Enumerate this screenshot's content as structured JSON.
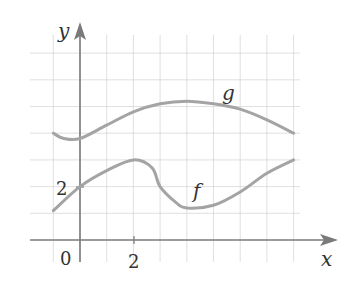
{
  "chart_data": {
    "type": "line",
    "title": "",
    "xlabel": "x",
    "ylabel": "y",
    "xlim": [
      -2,
      9.5
    ],
    "ylim": [
      -0.8,
      7.5
    ],
    "grid": true,
    "x_tick_labels": [
      {
        "value": 0,
        "label": "0"
      },
      {
        "value": 2,
        "label": "2"
      }
    ],
    "y_tick_labels": [
      {
        "value": 2,
        "label": "2"
      }
    ],
    "series": [
      {
        "name": "g",
        "points": [
          [
            -1,
            4.0
          ],
          [
            -0.6,
            3.8
          ],
          [
            0,
            3.8
          ],
          [
            1,
            4.3
          ],
          [
            2,
            4.8
          ],
          [
            3,
            5.1
          ],
          [
            4,
            5.2
          ],
          [
            5,
            5.1
          ],
          [
            6,
            4.9
          ],
          [
            7,
            4.5
          ],
          [
            8,
            4.0
          ]
        ],
        "label_position": [
          5.5,
          5.6
        ]
      },
      {
        "name": "f",
        "points": [
          [
            -1,
            1.1
          ],
          [
            0,
            2.0
          ],
          [
            1,
            2.6
          ],
          [
            2,
            3.0
          ],
          [
            2.7,
            2.7
          ],
          [
            3,
            2.0
          ],
          [
            3.6,
            1.4
          ],
          [
            4,
            1.2
          ],
          [
            5,
            1.3
          ],
          [
            6,
            1.8
          ],
          [
            7,
            2.5
          ],
          [
            8,
            3.0
          ]
        ],
        "label_position": [
          4.4,
          1.7
        ]
      }
    ],
    "legend": "none (curves labeled inline)",
    "colors": {
      "curve": "#a4a4a4",
      "axis": "#7a7a7a",
      "grid": "#d8d8d8"
    }
  },
  "labels": {
    "x_axis": "x",
    "y_axis": "y",
    "origin": "0",
    "x_tick_2": "2",
    "y_tick_2": "2",
    "curve_g": "g",
    "curve_f": "f"
  }
}
